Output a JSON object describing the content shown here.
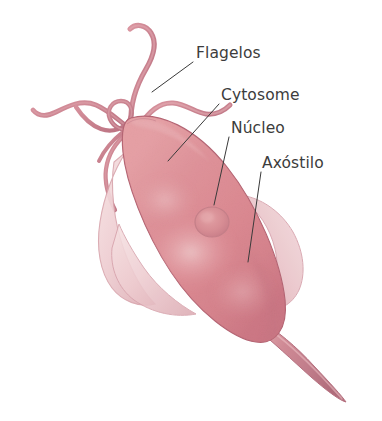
{
  "figure": {
    "background_color": "#ffffff",
    "organism": "Trichomonas",
    "width": 382,
    "height": 421
  },
  "labels": [
    {
      "id": "flagelos",
      "text": "Flagelos",
      "name": "label-flagelos",
      "text_x": 196,
      "text_y": 58,
      "leader": "M 193 62 L 152 92",
      "points_to": "flagella"
    },
    {
      "id": "cytosome",
      "text": "Cytosome",
      "name": "label-cytosome",
      "text_x": 221,
      "text_y": 100,
      "leader": "M 219 104 L 168 161",
      "points_to": "cytosome"
    },
    {
      "id": "nucleo",
      "text": "Núcleo",
      "name": "label-nucleo",
      "text_x": 231,
      "text_y": 133,
      "leader": "M 229 137 L 214 205",
      "points_to": "nucleus"
    },
    {
      "id": "axostilo",
      "text": "Axóstilo",
      "name": "label-axostilo",
      "text_x": 262,
      "text_y": 168,
      "leader": "M 261 172 L 248 262",
      "points_to": "axostyle"
    }
  ],
  "structures": {
    "cell_body": {
      "name": "cell-body",
      "description": "Elongated ovoid pink cell body tilted about 35 degrees",
      "fill_light": "#e8a0a4",
      "fill_mid": "#dd8a92",
      "fill_dark": "#c86f7c",
      "outline": "#b26271"
    },
    "nucleus": {
      "name": "nucleus",
      "description": "Oval nucleus in lower-middle of cell",
      "cx": 212,
      "cy": 222,
      "rx": 16,
      "ry": 14,
      "fill": "#d98d93",
      "outline": "#c47f88"
    },
    "undulating_membrane": {
      "name": "undulating-membrane",
      "description": "Pale translucent membrane along left and right flanks",
      "fill": "#f0cfd2",
      "outline": "#d9aab0"
    },
    "axostyle": {
      "name": "axostyle",
      "description": "Tapering spike extending from posterior end toward lower right",
      "fill": "#cc8693",
      "outline": "#b5707f"
    },
    "flagella": {
      "name": "flagella",
      "description": "Several long curving flagella emerging from anterior pole",
      "count": 5,
      "stroke": "#c27b88",
      "fill": "#d08e99"
    }
  },
  "colors": {
    "text": "#3c3c3c",
    "leader_line": "#3a3a3a",
    "cell_pink": "#dd8a92",
    "membrane_pale": "#f0cfd2",
    "background": "#ffffff"
  }
}
